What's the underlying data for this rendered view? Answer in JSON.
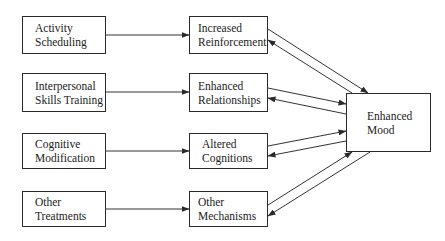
{
  "diagram": {
    "treatments": [
      {
        "line1": "Activity",
        "line2": "Scheduling"
      },
      {
        "line1": "Interpersonal",
        "line2": "Skills Training"
      },
      {
        "line1": "Cognitive",
        "line2": "Modification"
      },
      {
        "line1": "Other",
        "line2": "Treatments"
      }
    ],
    "mechanisms": [
      {
        "line1": "Increased",
        "line2": "Reinforcement"
      },
      {
        "line1": "Enhanced",
        "line2": "Relationships"
      },
      {
        "line1": "Altered",
        "line2": "Cognitions"
      },
      {
        "line1": "Other",
        "line2": "Mechanisms"
      }
    ],
    "outcome": {
      "line1": "Enhanced",
      "line2": "Mood"
    },
    "edges": [
      {
        "from": "Activity Scheduling",
        "to": "Increased Reinforcement"
      },
      {
        "from": "Interpersonal Skills Training",
        "to": "Enhanced Relationships"
      },
      {
        "from": "Cognitive Modification",
        "to": "Altered Cognitions"
      },
      {
        "from": "Other Treatments",
        "to": "Other Mechanisms"
      },
      {
        "from": "Increased Reinforcement",
        "to": "Enhanced Mood",
        "bidirectional": true
      },
      {
        "from": "Enhanced Relationships",
        "to": "Enhanced Mood",
        "bidirectional": true
      },
      {
        "from": "Altered Cognitions",
        "to": "Enhanced Mood",
        "bidirectional": true
      },
      {
        "from": "Other Mechanisms",
        "to": "Enhanced Mood",
        "bidirectional": true
      }
    ]
  }
}
